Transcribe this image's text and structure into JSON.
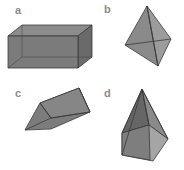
{
  "panels": [
    {
      "label": "a",
      "shape": "rectangular-prism"
    },
    {
      "label": "b",
      "shape": "tetrahedron"
    },
    {
      "label": "c",
      "shape": "triangular-prism"
    },
    {
      "label": "d",
      "shape": "pentagonal-pyramid"
    }
  ],
  "colors": {
    "face": "#7d7d7d",
    "face_light": "#9a9a9a",
    "face_dark": "#5e5e5e",
    "edge": "#3a3a3a"
  }
}
